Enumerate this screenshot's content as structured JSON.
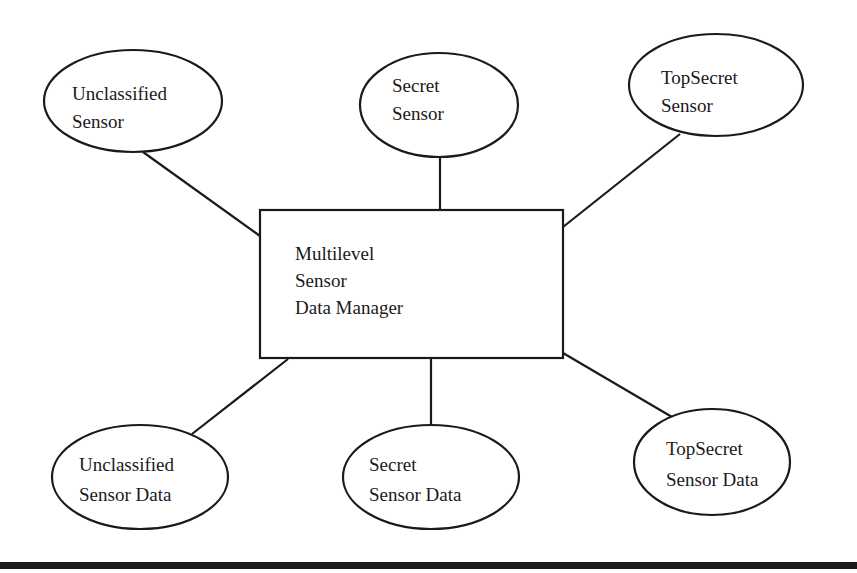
{
  "diagram": {
    "center": {
      "lines": [
        "Multilevel",
        "Sensor",
        "Data Manager"
      ]
    },
    "sensors": [
      {
        "lines": [
          "Unclassified",
          "Sensor"
        ]
      },
      {
        "lines": [
          "Secret",
          "Sensor"
        ]
      },
      {
        "lines": [
          "TopSecret",
          "Sensor"
        ]
      }
    ],
    "data_stores": [
      {
        "lines": [
          "Unclassified",
          "Sensor Data"
        ]
      },
      {
        "lines": [
          "Secret",
          "Sensor Data"
        ]
      },
      {
        "lines": [
          "TopSecret",
          "Sensor Data"
        ]
      }
    ]
  }
}
